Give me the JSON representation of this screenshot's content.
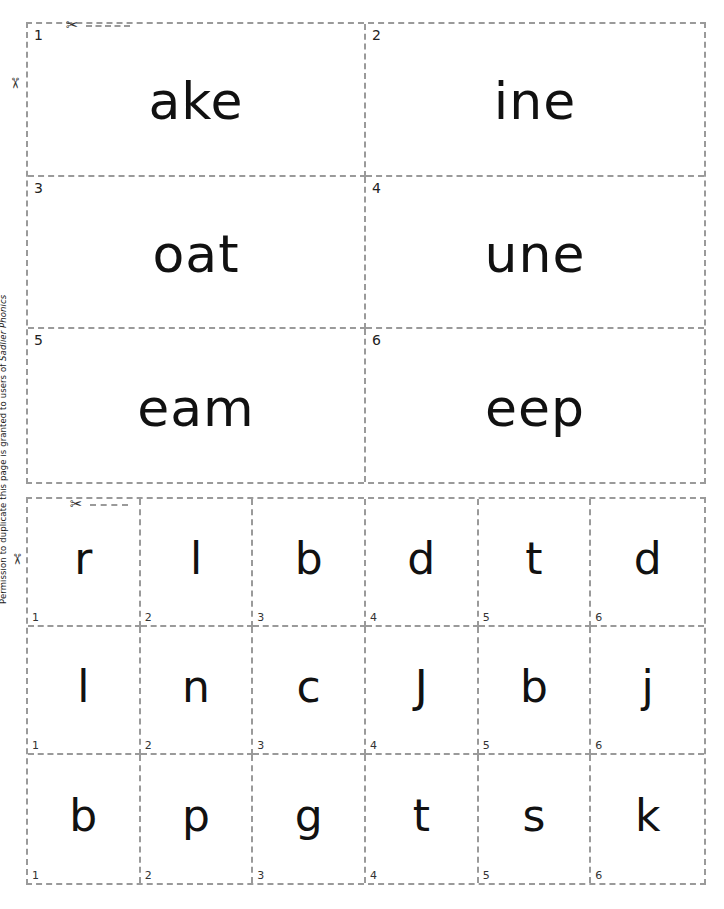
{
  "document": {
    "footer_note_prefix": "Permission to duplicate this page is granted to users of ",
    "footer_note_brand": "Sadlier Phonics",
    "cut_icon": "scissors-icon"
  },
  "top_section": {
    "cards": [
      {
        "number": "1",
        "text": "ake"
      },
      {
        "number": "2",
        "text": "ine"
      },
      {
        "number": "3",
        "text": "oat"
      },
      {
        "number": "4",
        "text": "une"
      },
      {
        "number": "5",
        "text": "eam"
      },
      {
        "number": "6",
        "text": "eep"
      }
    ]
  },
  "bottom_section": {
    "cards": [
      {
        "number": "1",
        "text": "r"
      },
      {
        "number": "2",
        "text": "l"
      },
      {
        "number": "3",
        "text": "b"
      },
      {
        "number": "4",
        "text": "d"
      },
      {
        "number": "5",
        "text": "t"
      },
      {
        "number": "6",
        "text": "d"
      },
      {
        "number": "1",
        "text": "l"
      },
      {
        "number": "2",
        "text": "n"
      },
      {
        "number": "3",
        "text": "c"
      },
      {
        "number": "4",
        "text": "J"
      },
      {
        "number": "5",
        "text": "b"
      },
      {
        "number": "6",
        "text": "j"
      },
      {
        "number": "1",
        "text": "b"
      },
      {
        "number": "2",
        "text": "p"
      },
      {
        "number": "3",
        "text": "g"
      },
      {
        "number": "4",
        "text": "t"
      },
      {
        "number": "5",
        "text": "s"
      },
      {
        "number": "6",
        "text": "k"
      }
    ]
  }
}
